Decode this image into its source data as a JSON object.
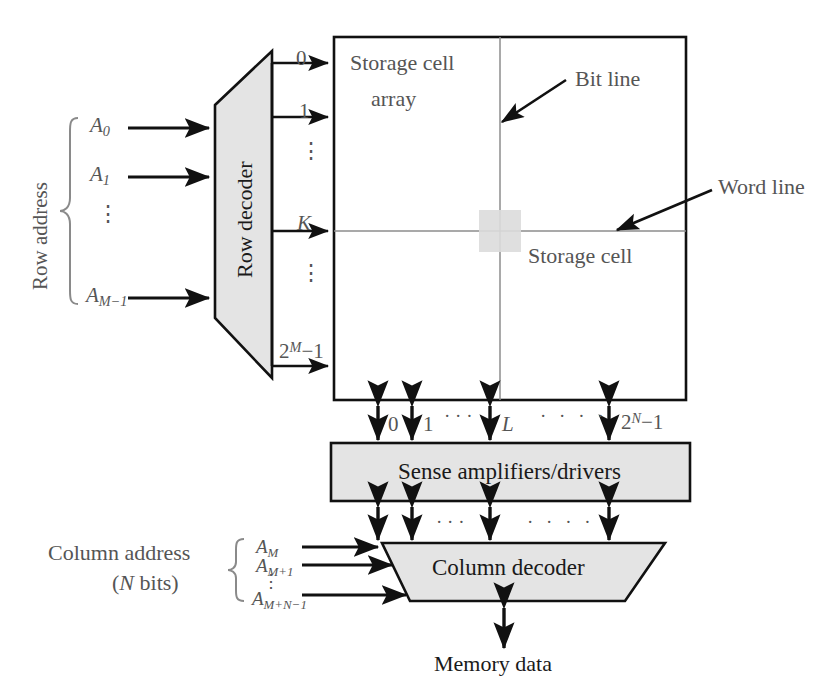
{
  "diagram": {
    "colors": {
      "block_fill": "#e4e4e4",
      "stroke": "#111111",
      "text": "#555555",
      "array_grid": "#777777",
      "cell_highlight": "#d9d9d9"
    },
    "blocks": {
      "row_decoder": {
        "label": "Row decoder"
      },
      "storage_array": {
        "label_line1": "Storage cell",
        "label_line2": "array"
      },
      "sense_amplifiers": {
        "label": "Sense amplifiers/drivers"
      },
      "column_decoder": {
        "label": "Column decoder"
      }
    },
    "row_address": {
      "group_label": "Row address",
      "signals": [
        "A0",
        "A1",
        "AM-1"
      ],
      "signal_parts": [
        {
          "base": "A",
          "sub": "0"
        },
        {
          "base": "A",
          "sub": "1"
        },
        {
          "base": "A",
          "sub": "M−1"
        }
      ],
      "ellipsis": "⋮"
    },
    "column_address": {
      "group_label_line1": "Column address",
      "group_label_line2": "(N bits)",
      "group_label_line2_parts": {
        "prefix": "(",
        "italic": "N",
        "suffix": " bits)"
      },
      "signal_parts": [
        {
          "base": "A",
          "sub": "M"
        },
        {
          "base": "A",
          "sub": "M+1"
        },
        {
          "base": "A",
          "sub": "M+N−1"
        }
      ],
      "ellipsis": "⋮"
    },
    "word_line_indices": {
      "items": [
        "0",
        "1",
        "K",
        "2M-1"
      ],
      "first": "0",
      "second": "1",
      "selected": "K",
      "last_parts": {
        "base": "2",
        "sup": "M",
        "suffix": "−1"
      },
      "vertical_ellipsis": "⋮"
    },
    "bit_line_indices": {
      "first": "0",
      "second": "1",
      "selected": "L",
      "last_parts": {
        "base": "2",
        "sup": "N",
        "suffix": "−1"
      },
      "dots_small": "· · ·",
      "dots_wide": "· · · ·"
    },
    "annotations": {
      "bit_line": "Bit line",
      "word_line": "Word line",
      "storage_cell": "Storage cell",
      "memory_data": "Memory data"
    }
  }
}
